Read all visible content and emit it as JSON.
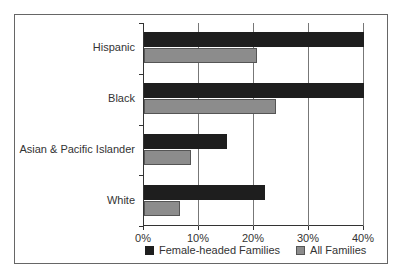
{
  "chart_data": {
    "type": "bar",
    "orientation": "horizontal",
    "title": "",
    "xlabel": "",
    "ylabel": "",
    "categories": [
      "Hispanic",
      "Black",
      "Asian & Pacific Islander",
      "White"
    ],
    "series": [
      {
        "name": "Female-headed Families",
        "color": "#1e1e1e",
        "values": [
          40,
          40,
          15,
          22
        ]
      },
      {
        "name": "All Families",
        "color": "#8c8c8c",
        "values": [
          20.5,
          24,
          8.5,
          6.5
        ]
      }
    ],
    "xlim": [
      0,
      40
    ],
    "xticks": [
      "0%",
      "10%",
      "20%",
      "30%",
      "40%"
    ],
    "grid": true,
    "legend_position": "bottom"
  },
  "labels": {
    "categories": [
      "Hispanic",
      "Black",
      "Asian & Pacific Islander",
      "White"
    ],
    "xticks": [
      "0%",
      "10%",
      "20%",
      "30%",
      "40%"
    ],
    "legend": [
      "Female-headed Families",
      "All Families"
    ]
  }
}
